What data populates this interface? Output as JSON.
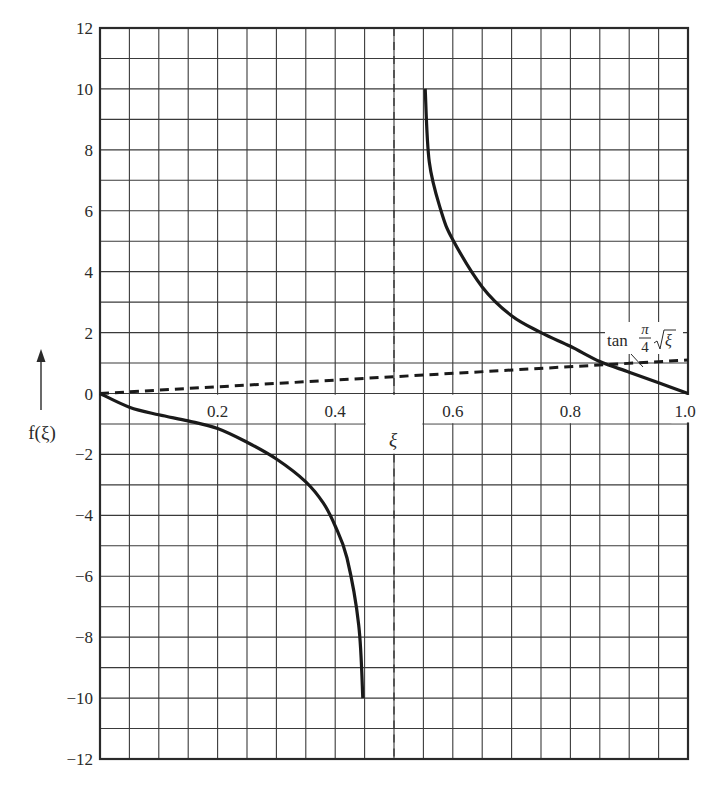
{
  "chart_data": {
    "type": "line",
    "title": "",
    "xlabel": "ξ",
    "ylabel": "f(ξ)",
    "xlim": [
      0,
      1.0
    ],
    "ylim": [
      -12,
      12
    ],
    "grid": true,
    "grid_x_step": 0.05,
    "grid_y_step": 1,
    "x_ticks": [
      {
        "value": 0.2,
        "label": "0.2"
      },
      {
        "value": 0.4,
        "label": "0.4"
      },
      {
        "value": 0.6,
        "label": "0.6"
      },
      {
        "value": 0.8,
        "label": "0.8"
      },
      {
        "value": 1.0,
        "label": "1.0"
      }
    ],
    "y_ticks": [
      {
        "value": 12,
        "label": "12"
      },
      {
        "value": 10,
        "label": "10"
      },
      {
        "value": 8,
        "label": "8"
      },
      {
        "value": 6,
        "label": "6"
      },
      {
        "value": 4,
        "label": "4"
      },
      {
        "value": 2,
        "label": "2"
      },
      {
        "value": 0,
        "label": "0"
      },
      {
        "value": -2,
        "label": "−2"
      },
      {
        "value": -4,
        "label": "−4"
      },
      {
        "value": -6,
        "label": "−6"
      },
      {
        "value": -8,
        "label": "−8"
      },
      {
        "value": -10,
        "label": "−10"
      },
      {
        "value": -12,
        "label": "−12"
      }
    ],
    "series": [
      {
        "name": "f(ξ) lower branch",
        "style": "solid",
        "x": [
          0.0,
          0.05,
          0.1,
          0.15,
          0.2,
          0.25,
          0.3,
          0.35,
          0.38,
          0.4,
          0.42,
          0.44,
          0.447
        ],
        "y": [
          0.0,
          -0.45,
          -0.7,
          -0.9,
          -1.15,
          -1.6,
          -2.15,
          -2.9,
          -3.6,
          -4.35,
          -5.4,
          -7.6,
          -10.0
        ]
      },
      {
        "name": "f(ξ) upper branch",
        "style": "solid",
        "x": [
          0.553,
          0.56,
          0.58,
          0.6,
          0.65,
          0.7,
          0.75,
          0.8,
          0.85,
          0.9,
          0.95,
          1.0
        ],
        "y": [
          10.0,
          7.6,
          6.0,
          5.05,
          3.5,
          2.55,
          2.0,
          1.55,
          1.05,
          0.7,
          0.35,
          0.0
        ]
      },
      {
        "name": "tan (π/4)√ξ",
        "style": "dashed",
        "x": [
          0.0,
          0.5,
          1.0
        ],
        "y": [
          0.0,
          0.55,
          1.1
        ]
      }
    ],
    "asymptote": {
      "x": 0.5,
      "style": "dashed"
    },
    "annotations": [
      {
        "text": "tan",
        "fraction_num": "π",
        "fraction_den": "4",
        "sqrt_arg": "ξ",
        "points_to": [
          0.89,
          1.0
        ]
      }
    ]
  },
  "labels": {
    "x_axis": "ξ",
    "y_axis": "f(ξ)",
    "curve_annotation_tan": "tan",
    "curve_annotation_num": "π",
    "curve_annotation_den": "4",
    "curve_annotation_sqrt_arg": "ξ"
  },
  "colors": {
    "grid": "#3a3a3a",
    "curve": "#1a1a1a",
    "text": "#2a2a2a",
    "background": "#ffffff"
  }
}
